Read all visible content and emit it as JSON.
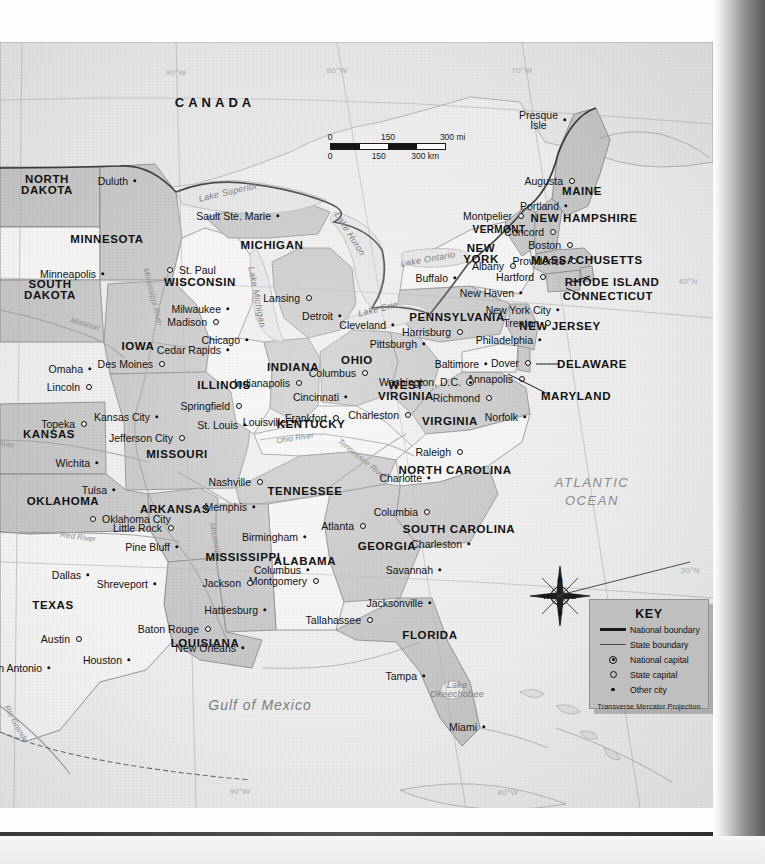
{
  "map": {
    "title": "Eastern United States Reference Map",
    "country_labels": [
      {
        "name": "CANADA",
        "x": 215,
        "y": 60
      }
    ],
    "ocean_labels": [
      {
        "name": "ATLANTIC\nOCEAN",
        "x": 592,
        "y": 450
      }
    ],
    "gulf_label": {
      "name": "Gulf   of   Mexico",
      "x": 260,
      "y": 663
    },
    "scale": {
      "miles_ticks": [
        "0",
        "150",
        "300 mi"
      ],
      "km_ticks": [
        "0",
        "150",
        "300 km"
      ]
    },
    "compass": {
      "n": "N",
      "e": "E",
      "s": "S",
      "w": "W"
    },
    "key": {
      "title": "KEY",
      "items": [
        {
          "symbol": "national-boundary",
          "label": "National boundary"
        },
        {
          "symbol": "state-boundary",
          "label": "State boundary"
        },
        {
          "symbol": "national-capital",
          "label": "National capital"
        },
        {
          "symbol": "state-capital",
          "label": "State capital"
        },
        {
          "symbol": "other-city",
          "label": "Other city"
        }
      ],
      "projection": "Transverse Mercator Projection"
    },
    "graticule_labels": [
      {
        "label": "90°W",
        "x": 176,
        "y": 30
      },
      {
        "label": "80°W",
        "x": 337,
        "y": 28
      },
      {
        "label": "70°W",
        "x": 522,
        "y": 28
      },
      {
        "label": "90°W",
        "x": 240,
        "y": 749
      },
      {
        "label": "80°W",
        "x": 508,
        "y": 750
      },
      {
        "label": "40°N",
        "x": 688,
        "y": 239
      },
      {
        "label": "30°N",
        "x": 690,
        "y": 528
      }
    ],
    "states": [
      {
        "name": "NORTH\nDAKOTA",
        "x": 47,
        "y": 143,
        "size": "normal"
      },
      {
        "name": "SOUTH\nDAKOTA",
        "x": 50,
        "y": 248,
        "size": "normal"
      },
      {
        "name": "MINNESOTA",
        "x": 107,
        "y": 197,
        "size": "normal"
      },
      {
        "name": "WISCONSIN",
        "x": 200,
        "y": 240,
        "size": "normal"
      },
      {
        "name": "MICHIGAN",
        "x": 272,
        "y": 203,
        "size": "normal"
      },
      {
        "name": "IOWA",
        "x": 138,
        "y": 304,
        "size": "normal"
      },
      {
        "name": "ILLINOIS",
        "x": 224,
        "y": 343,
        "size": "normal"
      },
      {
        "name": "INDIANA",
        "x": 293,
        "y": 325,
        "size": "normal"
      },
      {
        "name": "OHIO",
        "x": 357,
        "y": 318,
        "size": "normal"
      },
      {
        "name": "KANSAS",
        "x": 49,
        "y": 392,
        "size": "normal"
      },
      {
        "name": "MISSOURI",
        "x": 177,
        "y": 412,
        "size": "normal"
      },
      {
        "name": "KENTUCKY",
        "x": 311,
        "y": 382,
        "size": "normal"
      },
      {
        "name": "WEST\nVIRGINIA",
        "x": 406,
        "y": 349,
        "size": "normal"
      },
      {
        "name": "VIRGINIA",
        "x": 450,
        "y": 379,
        "size": "normal"
      },
      {
        "name": "PENNSYLVANIA",
        "x": 457,
        "y": 275,
        "size": "normal"
      },
      {
        "name": "NEW\nYORK",
        "x": 481,
        "y": 212,
        "size": "normal"
      },
      {
        "name": "VERMONT",
        "x": 499,
        "y": 187,
        "size": "small"
      },
      {
        "name": "NEW HAMPSHIRE",
        "x": 584,
        "y": 176,
        "size": "normal"
      },
      {
        "name": "MAINE",
        "x": 582,
        "y": 149,
        "size": "normal"
      },
      {
        "name": "MASSACHUSETTS",
        "x": 587,
        "y": 218,
        "size": "normal"
      },
      {
        "name": "RHODE ISLAND",
        "x": 612,
        "y": 240,
        "size": "normal"
      },
      {
        "name": "CONNECTICUT",
        "x": 608,
        "y": 254,
        "size": "normal"
      },
      {
        "name": "NEW JERSEY",
        "x": 560,
        "y": 284,
        "size": "normal"
      },
      {
        "name": "DELAWARE",
        "x": 592,
        "y": 322,
        "size": "normal"
      },
      {
        "name": "MARYLAND",
        "x": 576,
        "y": 354,
        "size": "normal"
      },
      {
        "name": "OKLAHOMA",
        "x": 63,
        "y": 459,
        "size": "normal"
      },
      {
        "name": "ARKANSAS",
        "x": 175,
        "y": 467,
        "size": "normal"
      },
      {
        "name": "TENNESSEE",
        "x": 305,
        "y": 449,
        "size": "normal"
      },
      {
        "name": "NORTH CAROLINA",
        "x": 455,
        "y": 428,
        "size": "normal"
      },
      {
        "name": "SOUTH CAROLINA",
        "x": 459,
        "y": 487,
        "size": "normal"
      },
      {
        "name": "GEORGIA",
        "x": 387,
        "y": 504,
        "size": "normal"
      },
      {
        "name": "ALABAMA",
        "x": 305,
        "y": 519,
        "size": "normal"
      },
      {
        "name": "MISSISSIPPI",
        "x": 243,
        "y": 515,
        "size": "normal"
      },
      {
        "name": "LOUISIANA",
        "x": 205,
        "y": 601,
        "size": "normal"
      },
      {
        "name": "TEXAS",
        "x": 53,
        "y": 563,
        "size": "normal"
      },
      {
        "name": "FLORIDA",
        "x": 430,
        "y": 593,
        "size": "normal"
      }
    ],
    "cities": [
      {
        "name": "Duluth",
        "x": 135,
        "y": 139,
        "type": "other",
        "anchor": "right"
      },
      {
        "name": "Minneapolis",
        "x": 103,
        "y": 232,
        "type": "other",
        "anchor": "right"
      },
      {
        "name": "St. Paul",
        "x": 170,
        "y": 228,
        "type": "cap",
        "anchor": "left"
      },
      {
        "name": "Sault Ste. Marie",
        "x": 278,
        "y": 174,
        "type": "other",
        "anchor": "right"
      },
      {
        "name": "Milwaukee",
        "x": 228,
        "y": 267,
        "type": "other",
        "anchor": "right"
      },
      {
        "name": "Madison",
        "x": 216,
        "y": 280,
        "type": "cap",
        "anchor": "right"
      },
      {
        "name": "Chicago",
        "x": 247,
        "y": 298,
        "type": "other",
        "anchor": "right"
      },
      {
        "name": "Lansing",
        "x": 309,
        "y": 256,
        "type": "cap",
        "anchor": "right"
      },
      {
        "name": "Detroit",
        "x": 340,
        "y": 274,
        "type": "other",
        "anchor": "right"
      },
      {
        "name": "Cleveland",
        "x": 393,
        "y": 283,
        "type": "other",
        "anchor": "right"
      },
      {
        "name": "Cedar Rapids",
        "x": 228,
        "y": 308,
        "type": "other",
        "anchor": "right"
      },
      {
        "name": "Des Moines",
        "x": 162,
        "y": 322,
        "type": "cap",
        "anchor": "right"
      },
      {
        "name": "Omaha",
        "x": 90,
        "y": 327,
        "type": "other",
        "anchor": "right"
      },
      {
        "name": "Lincoln",
        "x": 89,
        "y": 345,
        "type": "cap",
        "anchor": "right"
      },
      {
        "name": "Indianapolis",
        "x": 299,
        "y": 341,
        "type": "cap",
        "anchor": "right"
      },
      {
        "name": "Columbus",
        "x": 365,
        "y": 331,
        "type": "cap",
        "anchor": "right"
      },
      {
        "name": "Springfield",
        "x": 239,
        "y": 364,
        "type": "cap",
        "anchor": "right"
      },
      {
        "name": "Cincinnati",
        "x": 346,
        "y": 355,
        "type": "other",
        "anchor": "right"
      },
      {
        "name": "Charleston",
        "x": 408,
        "y": 373,
        "type": "cap",
        "anchor": "right"
      },
      {
        "name": "Richmond",
        "x": 489,
        "y": 356,
        "type": "cap",
        "anchor": "right"
      },
      {
        "name": "Norfolk",
        "x": 525,
        "y": 375,
        "type": "other",
        "anchor": "right"
      },
      {
        "name": "Frankfort",
        "x": 336,
        "y": 376,
        "type": "cap",
        "anchor": "right"
      },
      {
        "name": "Louisville",
        "x": 293,
        "y": 380,
        "type": "other",
        "anchor": "right"
      },
      {
        "name": "St. Louis",
        "x": 245,
        "y": 383,
        "type": "other",
        "anchor": "right"
      },
      {
        "name": "Kansas City",
        "x": 157,
        "y": 375,
        "type": "other",
        "anchor": "right"
      },
      {
        "name": "Topeka",
        "x": 84,
        "y": 382,
        "type": "cap",
        "anchor": "right"
      },
      {
        "name": "Jefferson City",
        "x": 182,
        "y": 396,
        "type": "cap",
        "anchor": "right"
      },
      {
        "name": "Wichita",
        "x": 97,
        "y": 421,
        "type": "other",
        "anchor": "right"
      },
      {
        "name": "Tulsa",
        "x": 114,
        "y": 448,
        "type": "other",
        "anchor": "right"
      },
      {
        "name": "Oklahoma City",
        "x": 93,
        "y": 477,
        "type": "cap",
        "anchor": "left"
      },
      {
        "name": "Little Rock",
        "x": 171,
        "y": 486,
        "type": "cap",
        "anchor": "right"
      },
      {
        "name": "Pine Bluff",
        "x": 177,
        "y": 505,
        "type": "other",
        "anchor": "right"
      },
      {
        "name": "Memphis",
        "x": 254,
        "y": 465,
        "type": "other",
        "anchor": "right"
      },
      {
        "name": "Nashville",
        "x": 260,
        "y": 440,
        "type": "cap",
        "anchor": "right"
      },
      {
        "name": "Raleigh",
        "x": 460,
        "y": 410,
        "type": "cap",
        "anchor": "right"
      },
      {
        "name": "Charlotte",
        "x": 429,
        "y": 436,
        "type": "other",
        "anchor": "right"
      },
      {
        "name": "Columbia",
        "x": 427,
        "y": 470,
        "type": "cap",
        "anchor": "right"
      },
      {
        "name": "Charleston",
        "x": 469,
        "y": 502,
        "type": "other",
        "anchor": "right"
      },
      {
        "name": "Atlanta",
        "x": 363,
        "y": 484,
        "type": "cap",
        "anchor": "right"
      },
      {
        "name": "Savannah",
        "x": 440,
        "y": 528,
        "type": "other",
        "anchor": "right"
      },
      {
        "name": "Columbus",
        "x": 308,
        "y": 528,
        "type": "other",
        "anchor": "right"
      },
      {
        "name": "Birmingham",
        "x": 305,
        "y": 495,
        "type": "other",
        "anchor": "right"
      },
      {
        "name": "Montgomery",
        "x": 316,
        "y": 539,
        "type": "cap",
        "anchor": "right"
      },
      {
        "name": "Jackson",
        "x": 250,
        "y": 541,
        "type": "cap",
        "anchor": "right"
      },
      {
        "name": "Hattiesburg",
        "x": 265,
        "y": 568,
        "type": "other",
        "anchor": "right"
      },
      {
        "name": "Jacksonville",
        "x": 430,
        "y": 561,
        "type": "other",
        "anchor": "right"
      },
      {
        "name": "Tallahassee",
        "x": 370,
        "y": 578,
        "type": "cap",
        "anchor": "right"
      },
      {
        "name": "Tampa",
        "x": 424,
        "y": 634,
        "type": "other",
        "anchor": "right"
      },
      {
        "name": "Miami",
        "x": 484,
        "y": 685,
        "type": "other",
        "anchor": "right"
      },
      {
        "name": "Baton Rouge",
        "x": 208,
        "y": 587,
        "type": "cap",
        "anchor": "right"
      },
      {
        "name": "New Orleans",
        "x": 243,
        "y": 606,
        "type": "other",
        "anchor": "right"
      },
      {
        "name": "Shreveport",
        "x": 155,
        "y": 542,
        "type": "other",
        "anchor": "right"
      },
      {
        "name": "Dallas",
        "x": 88,
        "y": 533,
        "type": "other",
        "anchor": "right"
      },
      {
        "name": "Houston",
        "x": 129,
        "y": 618,
        "type": "other",
        "anchor": "right"
      },
      {
        "name": "Austin",
        "x": 79,
        "y": 597,
        "type": "cap",
        "anchor": "right"
      },
      {
        "name": "San Antonio",
        "x": 49,
        "y": 626,
        "type": "other",
        "anchor": "right"
      },
      {
        "name": "Presque\nIsle",
        "x": 565,
        "y": 78,
        "type": "other",
        "anchor": "right"
      },
      {
        "name": "Augusta",
        "x": 572,
        "y": 139,
        "type": "cap",
        "anchor": "right"
      },
      {
        "name": "Portland",
        "x": 566,
        "y": 164,
        "type": "other",
        "anchor": "right"
      },
      {
        "name": "Montpelier",
        "x": 521,
        "y": 174,
        "type": "cap",
        "anchor": "right"
      },
      {
        "name": "Concord",
        "x": 553,
        "y": 190,
        "type": "cap",
        "anchor": "right"
      },
      {
        "name": "Boston",
        "x": 570,
        "y": 203,
        "type": "cap",
        "anchor": "right"
      },
      {
        "name": "Providence",
        "x": 574,
        "y": 219,
        "type": "cap",
        "anchor": "right"
      },
      {
        "name": "Albany",
        "x": 513,
        "y": 224,
        "type": "cap",
        "anchor": "right"
      },
      {
        "name": "Hartford",
        "x": 543,
        "y": 235,
        "type": "cap",
        "anchor": "right"
      },
      {
        "name": "Buffalo",
        "x": 455,
        "y": 236,
        "type": "other",
        "anchor": "right"
      },
      {
        "name": "New Haven",
        "x": 521,
        "y": 251,
        "type": "other",
        "anchor": "right"
      },
      {
        "name": "New York City",
        "x": 558,
        "y": 268,
        "type": "other",
        "anchor": "right"
      },
      {
        "name": "Trenton",
        "x": 548,
        "y": 281,
        "type": "cap",
        "anchor": "right"
      },
      {
        "name": "Harrisburg",
        "x": 460,
        "y": 290,
        "type": "cap",
        "anchor": "right"
      },
      {
        "name": "Philadelphia",
        "x": 540,
        "y": 298,
        "type": "other",
        "anchor": "right"
      },
      {
        "name": "Pittsburgh",
        "x": 424,
        "y": 302,
        "type": "other",
        "anchor": "right"
      },
      {
        "name": "Baltimore",
        "x": 486,
        "y": 322,
        "type": "other",
        "anchor": "right"
      },
      {
        "name": "Dover",
        "x": 528,
        "y": 321,
        "type": "cap",
        "anchor": "right"
      },
      {
        "name": "Annapolis",
        "x": 522,
        "y": 337,
        "type": "cap",
        "anchor": "right"
      },
      {
        "name": "Washington, D.C.",
        "x": 470,
        "y": 340,
        "type": "natcap",
        "anchor": "right"
      }
    ],
    "water_labels": [
      {
        "name": "Lake Superior",
        "x": 228,
        "y": 150,
        "rot": -13
      },
      {
        "name": "Lake Huron",
        "x": 350,
        "y": 192,
        "rot": 58
      },
      {
        "name": "Lake Michigan",
        "x": 257,
        "y": 255,
        "rot": 79
      },
      {
        "name": "Lake Ontario",
        "x": 428,
        "y": 217,
        "rot": -10
      },
      {
        "name": "Lake Erie",
        "x": 378,
        "y": 267,
        "rot": -14
      },
      {
        "name": "Lake\nOkeechobee",
        "x": 457,
        "y": 648,
        "rot": 0
      }
    ],
    "river_labels": [
      {
        "name": "Mississippi River",
        "x": 153,
        "y": 255,
        "rot": 76
      },
      {
        "name": "Missouri",
        "x": 85,
        "y": 282,
        "rot": 16
      },
      {
        "name": "Ohio River",
        "x": 295,
        "y": 396,
        "rot": -9
      },
      {
        "name": "Tennessee River",
        "x": 362,
        "y": 417,
        "rot": 39
      },
      {
        "name": "Mississippi",
        "x": 216,
        "y": 500,
        "rot": 78
      },
      {
        "name": "Red River",
        "x": 78,
        "y": 495,
        "rot": 8
      },
      {
        "name": "River",
        "x": 5,
        "y": 402,
        "rot": 10
      },
      {
        "name": "Rio Grande",
        "x": 16,
        "y": 682,
        "rot": 62
      }
    ]
  }
}
